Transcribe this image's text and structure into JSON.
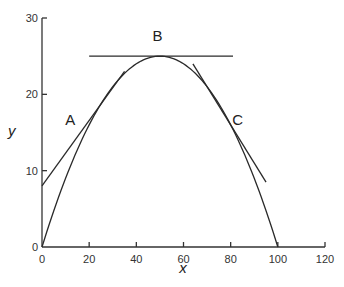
{
  "chart_data": {
    "type": "line",
    "title": "",
    "xlabel": "x",
    "ylabel": "y",
    "xlim": [
      0,
      120
    ],
    "ylim": [
      0,
      30
    ],
    "x_ticks": [
      "0",
      "20",
      "40",
      "60",
      "80",
      "100",
      "120"
    ],
    "y_ticks": [
      "0",
      "10",
      "20",
      "30"
    ],
    "grid": false,
    "series": [
      {
        "name": "curve",
        "description": "parabola y = x(100 - x)/100",
        "x": [
          0,
          10,
          20,
          30,
          40,
          50,
          60,
          70,
          80,
          90,
          100
        ],
        "y": [
          0,
          9,
          16,
          21,
          24,
          25,
          24,
          21,
          16,
          9,
          0
        ]
      },
      {
        "name": "tangent A",
        "x": [
          0,
          35
        ],
        "y": [
          8,
          23
        ]
      },
      {
        "name": "tangent B",
        "x": [
          20,
          81
        ],
        "y": [
          25,
          25
        ]
      },
      {
        "name": "tangent C",
        "x": [
          64,
          95
        ],
        "y": [
          24,
          8.5
        ]
      }
    ],
    "annotations": [
      {
        "label": "A",
        "x": 12,
        "y": 16
      },
      {
        "label": "B",
        "x": 49,
        "y": 27
      },
      {
        "label": "C",
        "x": 83,
        "y": 16
      }
    ]
  }
}
